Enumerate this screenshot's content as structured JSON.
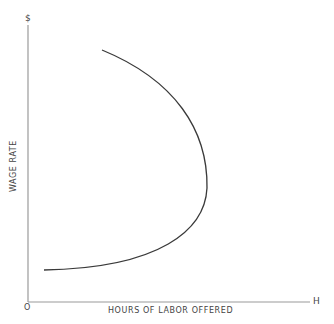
{
  "diagram": {
    "title": "",
    "y_axis_symbol": "$",
    "y_axis_label": "WAGE RATE",
    "x_axis_symbol": "H",
    "x_axis_label": "HOURS OF LABOR OFFERED",
    "origin_label": "O",
    "curve": {
      "name": "backward-bending labor supply curve",
      "color": "#333333"
    },
    "axis_color": "#999999"
  }
}
